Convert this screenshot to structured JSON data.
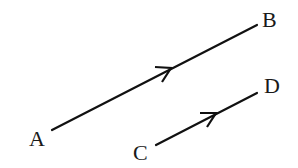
{
  "diagram": {
    "points": {
      "A": {
        "label": "A",
        "x": 52,
        "y": 130
      },
      "B": {
        "label": "B",
        "x": 257,
        "y": 25
      },
      "C": {
        "label": "C",
        "x": 156,
        "y": 145
      },
      "D": {
        "label": "D",
        "x": 257,
        "y": 93
      }
    },
    "segments": [
      {
        "from": "A",
        "to": "B",
        "arrow_direction": "A-to-B"
      },
      {
        "from": "C",
        "to": "D",
        "arrow_direction": "C-to-D"
      }
    ],
    "line_color": "#111111"
  }
}
